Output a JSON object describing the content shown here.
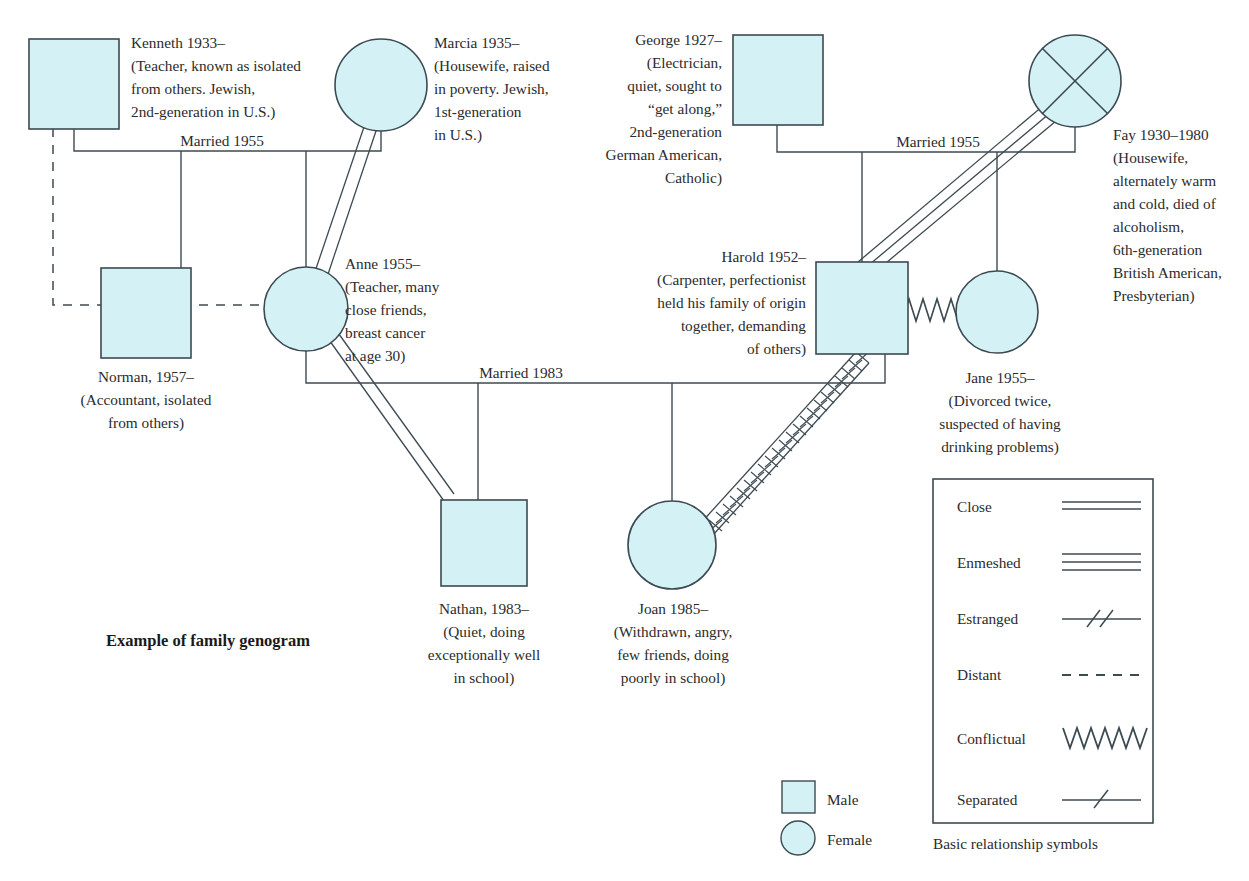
{
  "diagram": {
    "caption": "Example of family genogram",
    "title": "Example of family genogram"
  },
  "people": [
    {
      "id": "kenneth",
      "sex": "male",
      "deceased": false,
      "lines": [
        "Kenneth 1933–",
        "(Teacher, known as isolated",
        "from others. Jewish,",
        "2nd-generation in U.S.)"
      ],
      "align": "left"
    },
    {
      "id": "marcia",
      "sex": "female",
      "deceased": false,
      "lines": [
        "Marcia 1935–",
        "(Housewife, raised",
        "in poverty. Jewish,",
        "1st-generation",
        "in U.S.)"
      ],
      "align": "left"
    },
    {
      "id": "george",
      "sex": "male",
      "deceased": false,
      "lines": [
        "George 1927–",
        "(Electrician,",
        "quiet, sought to",
        "“get along,”",
        "2nd-generation",
        "German American,",
        "Catholic)"
      ],
      "align": "right"
    },
    {
      "id": "fay",
      "sex": "female",
      "deceased": true,
      "lines": [
        "Fay 1930–1980",
        "(Housewife,",
        "alternately warm",
        "and cold, died of",
        "alcoholism,",
        "6th-generation",
        "British American,",
        "Presbyterian)"
      ],
      "align": "left"
    },
    {
      "id": "norman",
      "sex": "male",
      "deceased": false,
      "lines": [
        "Norman, 1957–",
        "(Accountant, isolated",
        "from others)"
      ],
      "align": "center"
    },
    {
      "id": "anne",
      "sex": "female",
      "deceased": false,
      "lines": [
        "Anne 1955–",
        "(Teacher, many",
        "close friends,",
        "breast cancer",
        "at age 30)"
      ],
      "align": "left"
    },
    {
      "id": "harold",
      "sex": "male",
      "deceased": false,
      "lines": [
        "Harold 1952–",
        "(Carpenter, perfectionist",
        "held his family of origin",
        "together, demanding",
        "of others)"
      ],
      "align": "right"
    },
    {
      "id": "jane",
      "sex": "female",
      "deceased": false,
      "lines": [
        "Jane 1955–",
        "(Divorced twice,",
        "suspected of having",
        "drinking problems)"
      ],
      "align": "center"
    },
    {
      "id": "nathan",
      "sex": "male",
      "deceased": false,
      "lines": [
        "Nathan, 1983–",
        "(Quiet, doing",
        "exceptionally well",
        "in school)"
      ],
      "align": "center"
    },
    {
      "id": "joan",
      "sex": "female",
      "deceased": false,
      "lines": [
        "Joan 1985–",
        "(Withdrawn, angry,",
        "few friends, doing",
        "poorly in school)"
      ],
      "align": "center"
    }
  ],
  "marriages": [
    {
      "id": "kenneth-marcia",
      "label": "Married 1955",
      "partners": [
        "kenneth",
        "marcia"
      ]
    },
    {
      "id": "george-fay",
      "label": "Married 1955",
      "partners": [
        "george",
        "fay"
      ]
    },
    {
      "id": "anne-harold",
      "label": "Married 1983",
      "partners": [
        "anne",
        "harold"
      ]
    }
  ],
  "relationships": [
    {
      "from": "marcia",
      "to": "anne",
      "type": "close"
    },
    {
      "from": "anne",
      "to": "nathan",
      "type": "close"
    },
    {
      "from": "fay",
      "to": "harold",
      "type": "enmeshed"
    },
    {
      "from": "harold",
      "to": "jane",
      "type": "conflictual"
    },
    {
      "from": "harold",
      "to": "joan",
      "type": "estranged-conflictual"
    },
    {
      "from": "kenneth",
      "to": "norman",
      "type": "distant"
    }
  ],
  "key": {
    "items": [
      {
        "label": "Male",
        "shape": "square"
      },
      {
        "label": "Female",
        "shape": "circle"
      }
    ]
  },
  "legend": {
    "title": "Basic relationship symbols",
    "items": [
      {
        "label": "Close",
        "symbol": "two-parallel-lines"
      },
      {
        "label": "Enmeshed",
        "symbol": "three-parallel-lines"
      },
      {
        "label": "Estranged",
        "symbol": "line-with-two-slashes"
      },
      {
        "label": "Distant",
        "symbol": "dashed-line"
      },
      {
        "label": "Conflictual",
        "symbol": "zigzag-line"
      },
      {
        "label": "Separated",
        "symbol": "line-with-one-slash"
      }
    ]
  },
  "colors": {
    "shape_fill": "#d4f1f6",
    "shape_stroke": "#3c4a52",
    "line": "#3c4a52",
    "text": "#2b2b2b",
    "legend_border": "#3c4a52"
  }
}
